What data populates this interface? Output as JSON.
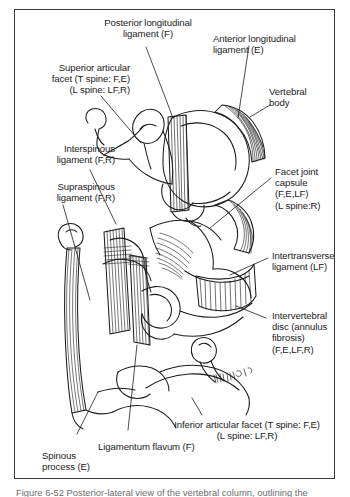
{
  "figure": {
    "type": "anatomical-illustration",
    "caption": "Figure 6-52 Posterior-lateral view of the vertebral column, outlining the",
    "artist_signature": "BW/REK",
    "labels": {
      "posterior_longitudinal_ligament": "Posterior longitudinal\nligament (F)",
      "anterior_longitudinal_ligament": "Anterior longitudinal\nligament (E)",
      "vertebral_body": "Vertebral\nbody",
      "superior_articular_facet": "Superior articular\nfacet (T spine: F,E)\n(L spine: LF,R)",
      "interspinous_ligament": "Interspinous\nligament (F,R)",
      "supraspinous_ligament": "Supraspinous\nligament (F,R)",
      "facet_joint_capsule": "Facet joint\ncapsule\n(F,E,LF)\n(L spine:R)",
      "intertransverse_ligament": "Intertransverse\nligament (LF)",
      "intervertebral_disc": "Intervertebral\ndisc (annulus\nfibrosis)\n(F,E,LF,R)",
      "inferior_articular_facet": "Inferior articular facet (T spine: F,E)\n(L spine: LF,R)",
      "ligamentum_flavum": "Ligamentum flavum (F)",
      "spinous_process": "Spinous\nprocess (E)"
    },
    "colors": {
      "ink": "#1c1c1c",
      "frame": "#3b3b3b",
      "caption": "#6d6d6d",
      "paper": "#ffffff"
    }
  }
}
